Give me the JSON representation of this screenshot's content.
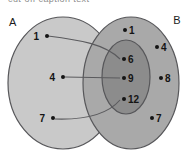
{
  "figure": {
    "type": "venn-mapping-diagram",
    "width": 189,
    "height": 152,
    "background": "#ffffff",
    "cropped_caption": "cut-off caption text"
  },
  "sets": {
    "left": {
      "name": "A",
      "label": "A",
      "fill": "#c9c9c9",
      "stroke": "#57575a",
      "cx": 63,
      "cy": 83,
      "rx": 55,
      "ry": 66
    },
    "right": {
      "name": "B",
      "label": "B",
      "fill": "#a9a9a9",
      "stroke": "#57575a",
      "cx": 131,
      "cy": 83,
      "rx": 48,
      "ry": 66
    },
    "inner": {
      "name": "A-intersect-B",
      "label": "",
      "fill": "#8c8c8c",
      "stroke": "#57575a",
      "cx": 126,
      "cy": 77,
      "rx": 24,
      "ry": 37
    }
  },
  "elements": {
    "left_set": [
      {
        "label": "1",
        "dot_x": 47,
        "dot_y": 36,
        "text_x": 39,
        "text_y": 40,
        "text_anchor": "end"
      },
      {
        "label": "4",
        "dot_x": 63,
        "dot_y": 77,
        "text_x": 55,
        "text_y": 81,
        "text_anchor": "end"
      },
      {
        "label": "7",
        "dot_x": 53,
        "dot_y": 118,
        "text_x": 45,
        "text_y": 122,
        "text_anchor": "end"
      }
    ],
    "right_set_outer": [
      {
        "label": "1",
        "dot_x": 125,
        "dot_y": 30,
        "text_x": 129,
        "text_y": 34,
        "text_anchor": "start"
      },
      {
        "label": "4",
        "dot_x": 157,
        "dot_y": 47,
        "text_x": 161,
        "text_y": 51,
        "text_anchor": "start"
      },
      {
        "label": "8",
        "dot_x": 161,
        "dot_y": 78,
        "text_x": 165,
        "text_y": 82,
        "text_anchor": "start"
      },
      {
        "label": "7",
        "dot_x": 152,
        "dot_y": 118,
        "text_x": 156,
        "text_y": 122,
        "text_anchor": "start"
      }
    ],
    "inner_set": [
      {
        "label": "6",
        "dot_x": 124,
        "dot_y": 59,
        "text_x": 128,
        "text_y": 63,
        "text_anchor": "start"
      },
      {
        "label": "9",
        "dot_x": 124,
        "dot_y": 78,
        "text_x": 128,
        "text_y": 82,
        "text_anchor": "start"
      },
      {
        "label": "12",
        "dot_x": 124,
        "dot_y": 99,
        "text_x": 128,
        "text_y": 103,
        "text_anchor": "start"
      }
    ]
  },
  "mappings": [
    {
      "name": "map-1-to-6",
      "from": "1",
      "to": "6",
      "path": "M 48,36 C 80,40 105,44 120,59",
      "stroke": "#5a5a5d"
    },
    {
      "name": "map-4-to-9",
      "from": "4",
      "to": "9",
      "path": "M 65,77 L 120,78",
      "stroke": "#5a5a5d"
    },
    {
      "name": "map-7-to-12",
      "from": "7",
      "to": "12",
      "path": "M 55,119 C 85,120 108,114 120,100",
      "stroke": "#5a5a5d"
    }
  ],
  "style": {
    "dot_color": "#141414",
    "dot_radius": 2.0,
    "line_width": 1.1,
    "ellipse_stroke_width": 1.2
  }
}
